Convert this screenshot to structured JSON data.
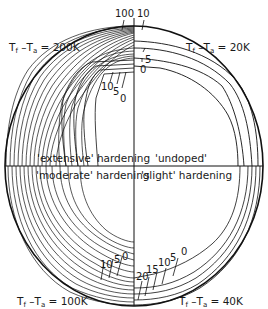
{
  "figure": {
    "corner_labels": {
      "top_left": {
        "prefix": "T",
        "sub1": "f",
        "mid": " –T",
        "sub2": "a",
        "value": " = 200K"
      },
      "top_right": {
        "prefix": "T",
        "sub1": "f",
        "mid": " –T",
        "sub2": "a",
        "value": " = 20K"
      },
      "bottom_left": {
        "prefix": "T",
        "sub1": "f",
        "mid": " –T",
        "sub2": "a",
        "value": " = 100K"
      },
      "bottom_right": {
        "prefix": "T",
        "sub1": "f",
        "mid": " –T",
        "sub2": "a",
        "value": " = 40K"
      }
    },
    "quadrant_labels": {
      "top_left": "'extensive' hardening",
      "top_right": "'undoped'",
      "bottom_left": "'moderate' hardening",
      "bottom_right": "'slight' hardening"
    },
    "contour_labels": {
      "top_center": [
        "100",
        "10"
      ],
      "top_right_inner": [
        "5",
        "0"
      ],
      "top_left_inner": [
        "10",
        "5",
        "0"
      ],
      "bottom_left_inner": [
        "10",
        "5",
        "0"
      ],
      "bottom_right_inner": [
        "20",
        "15",
        "10",
        "5",
        "0"
      ]
    }
  }
}
